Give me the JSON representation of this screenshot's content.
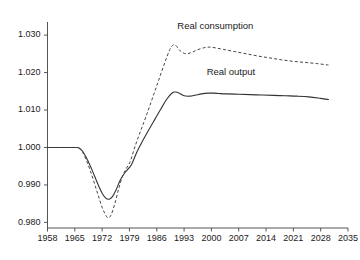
{
  "chart_data": {
    "type": "line",
    "title": "",
    "subtitle": "",
    "xlabel": "",
    "ylabel": "",
    "xlim": [
      1958,
      2035
    ],
    "ylim": [
      0.9785,
      1.0335
    ],
    "grid": false,
    "legend_position": "inline-annotations",
    "x_ticks": [
      "1958",
      "1965",
      "1972",
      "1979",
      "1986",
      "1993",
      "2000",
      "2007",
      "2014",
      "2021",
      "2028",
      "2035"
    ],
    "x_tick_values": [
      1958,
      1965,
      1972,
      1979,
      1986,
      1993,
      2000,
      2007,
      2014,
      2021,
      2028,
      2035
    ],
    "y_ticks": [
      "0.980",
      "0.990",
      "1.000",
      "1.010",
      "1.020",
      "1.030"
    ],
    "y_tick_values": [
      0.98,
      0.99,
      1.0,
      1.01,
      1.02,
      1.03
    ],
    "annotations": [
      {
        "text": "Real consumption",
        "x": 2001,
        "y": 1.0317
      },
      {
        "text": "Real output",
        "x": 2005,
        "y": 1.0193
      }
    ],
    "series": [
      {
        "name": "Real output",
        "style": "solid",
        "color": "#333333",
        "x": [
          1958,
          1960,
          1962,
          1964,
          1965,
          1966,
          1967,
          1968,
          1969,
          1970,
          1971,
          1972,
          1973,
          1973.8,
          1974.6,
          1975.5,
          1976.5,
          1977.5,
          1978.5,
          1979.5,
          1981,
          1982.5,
          1984,
          1985.5,
          1987,
          1988.5,
          1990,
          1990.8,
          1991.8,
          1993,
          1994.5,
          1996,
          1997.5,
          1999,
          2000.5,
          2002,
          2004,
          2007,
          2010,
          2013,
          2016,
          2019,
          2022,
          2025,
          2028,
          2030
        ],
        "y": [
          1.0,
          1.0,
          1.0,
          1.0,
          1.0,
          0.9999,
          0.999,
          0.9972,
          0.995,
          0.9925,
          0.99,
          0.9878,
          0.9864,
          0.9862,
          0.9868,
          0.9885,
          0.991,
          0.9928,
          0.9941,
          0.9954,
          0.999,
          1.002,
          1.0048,
          1.0075,
          1.0102,
          1.0128,
          1.0146,
          1.0148,
          1.0145,
          1.0138,
          1.0137,
          1.014,
          1.0143,
          1.0145,
          1.0145,
          1.0144,
          1.0143,
          1.0142,
          1.0141,
          1.014,
          1.0139,
          1.0138,
          1.0137,
          1.0135,
          1.0131,
          1.0128
        ]
      },
      {
        "name": "Real consumption",
        "style": "dashed",
        "color": "#444444",
        "x": [
          1958,
          1960,
          1962,
          1964,
          1965,
          1966,
          1967,
          1968,
          1969,
          1970,
          1971,
          1972,
          1973,
          1973.6,
          1974.3,
          1975.2,
          1976.2,
          1977.2,
          1978.2,
          1979.2,
          1980.5,
          1982,
          1983.5,
          1985,
          1986.5,
          1988,
          1989.2,
          1990,
          1990.8,
          1992,
          1993.5,
          1995,
          1996.5,
          1998,
          1999.5,
          2001,
          2003,
          2006,
          2009,
          2012,
          2015,
          2018,
          2021,
          2024,
          2027,
          2030
        ],
        "y": [
          1.0,
          1.0,
          1.0,
          1.0,
          1.0,
          0.9998,
          0.9987,
          0.9965,
          0.9937,
          0.9905,
          0.9872,
          0.984,
          0.9818,
          0.9812,
          0.982,
          0.9848,
          0.9888,
          0.9923,
          0.9944,
          0.9963,
          1.0005,
          1.0048,
          1.009,
          1.0135,
          1.018,
          1.0225,
          1.0258,
          1.0272,
          1.0273,
          1.0258,
          1.025,
          1.0254,
          1.0261,
          1.0266,
          1.0268,
          1.0266,
          1.0262,
          1.0256,
          1.025,
          1.0244,
          1.0239,
          1.0234,
          1.023,
          1.0227,
          1.0224,
          1.022
        ]
      }
    ]
  },
  "axis": {
    "y_axis_name": "value-axis",
    "x_axis_name": "year-axis"
  }
}
